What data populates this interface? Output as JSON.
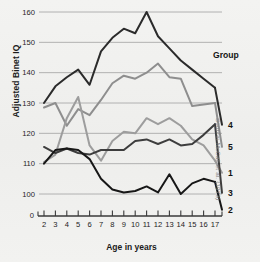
{
  "figure": {
    "ylabel": "Adjusted Binet IQ",
    "xlabel": "Age in years",
    "source": "Source: McCall et al. (1973)",
    "legend_title": "Group"
  },
  "chart_data": {
    "type": "line",
    "title": "",
    "xlabel": "Age in years",
    "ylabel": "Adjusted Binet IQ",
    "xlim": [
      2,
      17
    ],
    "ylim": [
      95,
      163
    ],
    "yticks": [
      100,
      110,
      120,
      130,
      140,
      150,
      160
    ],
    "ytick_labels": [
      "100",
      "110",
      "120",
      "130",
      "140",
      "150",
      "160"
    ],
    "axis_origin_label": "0",
    "axis_break": true,
    "grid": true,
    "legend_position": "right",
    "x": [
      2,
      3,
      4,
      5,
      6,
      7,
      8,
      9,
      10,
      11,
      12,
      13,
      14,
      15,
      16,
      17
    ],
    "categories": [
      "2",
      "3",
      "4",
      "5",
      "6",
      "7",
      "8",
      "9",
      "10",
      "11",
      "12",
      "13",
      "14",
      "15",
      "16",
      "17"
    ],
    "series": [
      {
        "name": "4",
        "label": "4",
        "color": "#2b2b2b",
        "values": [
          130,
          135.5,
          138.5,
          141,
          136,
          147,
          151.5,
          154.5,
          153,
          160,
          152,
          148,
          144,
          141,
          138,
          135
        ]
      },
      {
        "name": "5",
        "label": "5",
        "color": "#8e8e8e",
        "values": [
          128.5,
          130,
          122.5,
          128,
          126,
          131,
          136.5,
          139,
          138,
          140,
          143,
          138.5,
          138,
          129,
          129.5,
          130
        ]
      },
      {
        "name": "1",
        "label": "1",
        "color": "#9d9d9d",
        "values": [
          110.5,
          113,
          125,
          132,
          116,
          111,
          117.5,
          120.5,
          120,
          125,
          123,
          125,
          122.5,
          118,
          116,
          111
        ]
      },
      {
        "name": "3",
        "label": "3",
        "color": "#3d3d3d",
        "values": [
          115.5,
          113.5,
          115,
          113.5,
          113,
          114.5,
          114.5,
          114.5,
          117.5,
          118,
          116.5,
          118,
          116,
          116.5,
          119.5,
          123
        ]
      },
      {
        "name": "2",
        "label": "2",
        "color": "#171717",
        "values": [
          110,
          114.5,
          115,
          114.5,
          111.5,
          105,
          101.5,
          100.5,
          101,
          102.5,
          100.5,
          106.5,
          100,
          103.5,
          105,
          104
        ]
      }
    ],
    "legend_entries": [
      {
        "label": "4",
        "color": "#2b2b2b"
      },
      {
        "label": "5",
        "color": "#8e8e8e"
      },
      {
        "label": "1",
        "color": "#9d9d9d"
      },
      {
        "label": "3",
        "color": "#3d3d3d"
      },
      {
        "label": "2",
        "color": "#171717"
      }
    ],
    "legend_label_y": [
      128,
      150,
      176,
      196,
      213
    ]
  }
}
